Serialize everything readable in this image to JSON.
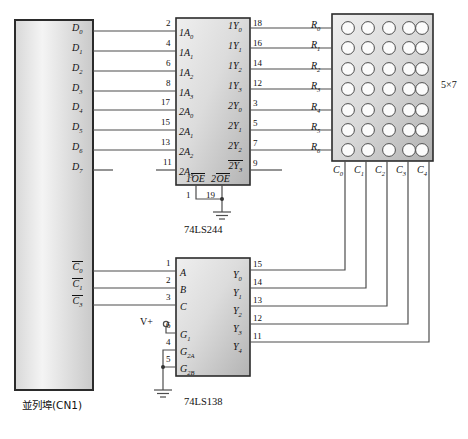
{
  "diagram": {
    "size_label": "5×7"
  },
  "parallel_port": {
    "name": "parallel-port-connector",
    "caption": "並列埠(CN1)",
    "data_pins": [
      {
        "label": "D",
        "sub": "0"
      },
      {
        "label": "D",
        "sub": "1"
      },
      {
        "label": "D",
        "sub": "2"
      },
      {
        "label": "D",
        "sub": "3"
      },
      {
        "label": "D",
        "sub": "4"
      },
      {
        "label": "D",
        "sub": "5"
      },
      {
        "label": "D",
        "sub": "6"
      },
      {
        "label": "D",
        "sub": "7"
      }
    ],
    "control_pins": [
      {
        "label": "C",
        "sub": "0",
        "overline": true
      },
      {
        "label": "C",
        "sub": "1",
        "overline": true
      },
      {
        "label": "C",
        "sub": "3",
        "overline": true
      }
    ]
  },
  "ls244": {
    "name": "74LS244",
    "caption": "74LS244",
    "inputs": [
      {
        "pin": "2",
        "label": "1A",
        "sub": "0"
      },
      {
        "pin": "4",
        "label": "1A",
        "sub": "1"
      },
      {
        "pin": "6",
        "label": "1A",
        "sub": "2"
      },
      {
        "pin": "8",
        "label": "1A",
        "sub": "3"
      },
      {
        "pin": "17",
        "label": "2A",
        "sub": "0"
      },
      {
        "pin": "15",
        "label": "2A",
        "sub": "1"
      },
      {
        "pin": "13",
        "label": "2A",
        "sub": "2"
      },
      {
        "pin": "11",
        "label": "2A",
        "sub": "3"
      }
    ],
    "outputs": [
      {
        "pin": "18",
        "label": "1Y",
        "sub": "0"
      },
      {
        "pin": "16",
        "label": "1Y",
        "sub": "1"
      },
      {
        "pin": "14",
        "label": "1Y",
        "sub": "2"
      },
      {
        "pin": "12",
        "label": "1Y",
        "sub": "3"
      },
      {
        "pin": "3",
        "label": "2Y",
        "sub": "0"
      },
      {
        "pin": "5",
        "label": "2Y",
        "sub": "1"
      },
      {
        "pin": "7",
        "label": "2Y",
        "sub": "2"
      },
      {
        "pin": "9",
        "label": "2Y",
        "sub": "3"
      }
    ],
    "enable": {
      "left_label": "1",
      "left_name": "OE",
      "right_label": "2",
      "right_name": "OE",
      "left_pin": "1",
      "right_pin": "19"
    }
  },
  "ls138": {
    "name": "74LS138",
    "caption": "74LS138",
    "inputs": [
      {
        "pin": "1",
        "label": "A",
        "sub": ""
      },
      {
        "pin": "2",
        "label": "B",
        "sub": ""
      },
      {
        "pin": "3",
        "label": "C",
        "sub": ""
      },
      {
        "pin": "6",
        "label": "G",
        "sub": "1"
      },
      {
        "pin": "4",
        "label": "G",
        "sub": "2A"
      },
      {
        "pin": "5",
        "label": "G",
        "sub": "2B"
      }
    ],
    "outputs": [
      {
        "pin": "15",
        "label": "Y",
        "sub": "0"
      },
      {
        "pin": "14",
        "label": "Y",
        "sub": "1"
      },
      {
        "pin": "13",
        "label": "Y",
        "sub": "2"
      },
      {
        "pin": "12",
        "label": "Y",
        "sub": "3"
      },
      {
        "pin": "11",
        "label": "Y",
        "sub": "4"
      }
    ],
    "power_label": "V+"
  },
  "matrix": {
    "name": "led-dot-matrix",
    "rows": 7,
    "cols": 5,
    "size_label": "5×7",
    "row_labels": [
      {
        "label": "R",
        "sub": "0"
      },
      {
        "label": "R",
        "sub": "1"
      },
      {
        "label": "R",
        "sub": "2"
      },
      {
        "label": "R",
        "sub": "3"
      },
      {
        "label": "R",
        "sub": "4"
      },
      {
        "label": "R",
        "sub": "5"
      },
      {
        "label": "R",
        "sub": "6"
      }
    ],
    "col_labels": [
      {
        "label": "C",
        "sub": "0"
      },
      {
        "label": "C",
        "sub": "1"
      },
      {
        "label": "C",
        "sub": "2"
      },
      {
        "label": "C",
        "sub": "3"
      },
      {
        "label": "C",
        "sub": "4"
      }
    ]
  },
  "colors": {
    "wire": "#4d4d4d",
    "outline": "#2b2b2b",
    "fill_light": "#f2f2f2",
    "fill_dark": "#b9b9b9",
    "text": "#111111"
  }
}
